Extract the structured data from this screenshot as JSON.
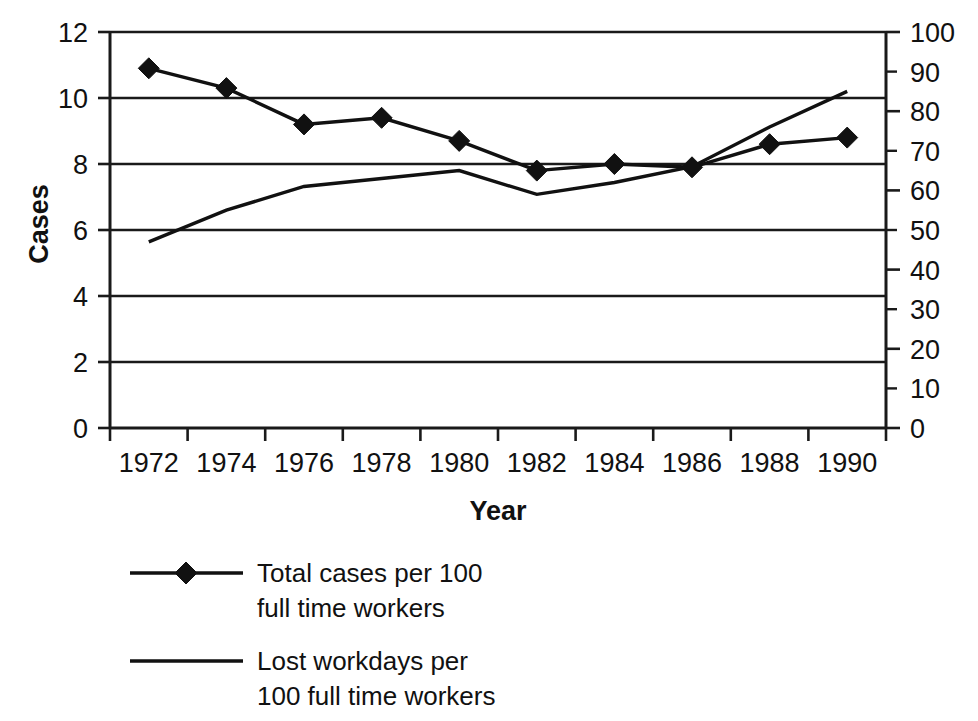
{
  "chart_data": {
    "type": "line",
    "title": "",
    "xlabel": "Year",
    "ylabel": "Cases",
    "y2label": "",
    "grid": true,
    "legend_position": "bottom-left",
    "categories": [
      1972,
      1974,
      1976,
      1978,
      1980,
      1982,
      1984,
      1986,
      1988,
      1990
    ],
    "xtick_labels": [
      "1972",
      "1974",
      "1976",
      "1978",
      "1980",
      "1982",
      "1984",
      "1986",
      "1988",
      "1990"
    ],
    "ylim": [
      0,
      12
    ],
    "ytick_labels": [
      "0",
      "2",
      "4",
      "6",
      "8",
      "10",
      "12"
    ],
    "ytick_values": [
      0,
      2,
      4,
      6,
      8,
      10,
      12
    ],
    "y2lim": [
      0,
      100
    ],
    "y2tick_labels": [
      "0",
      "10",
      "20",
      "30",
      "40",
      "50",
      "60",
      "70",
      "80",
      "90",
      "100"
    ],
    "y2tick_values": [
      0,
      10,
      20,
      30,
      40,
      50,
      60,
      70,
      80,
      90,
      100
    ],
    "series": [
      {
        "name": "Total cases per 100 full time workers",
        "legend_line1": "Total cases per 100",
        "legend_line2": "full time workers",
        "axis": "left",
        "marker": "diamond",
        "color": "#111111",
        "values": [
          10.9,
          10.3,
          9.2,
          9.4,
          8.7,
          7.8,
          8.0,
          7.9,
          8.6,
          8.8
        ]
      },
      {
        "name": "Lost workdays per 100 full time workers",
        "legend_line1": "Lost workdays per",
        "legend_line2": "100 full time workers",
        "axis": "right",
        "marker": "none",
        "color": "#111111",
        "values": [
          47,
          55,
          61,
          63,
          65,
          59,
          62,
          66,
          76,
          85
        ]
      }
    ]
  },
  "legend": {
    "entries": [
      {
        "line1": "Total cases per 100",
        "line2": "full time workers",
        "marker": "diamond"
      },
      {
        "line1": "Lost workdays per",
        "line2": "100 full time workers",
        "marker": "none"
      }
    ]
  }
}
